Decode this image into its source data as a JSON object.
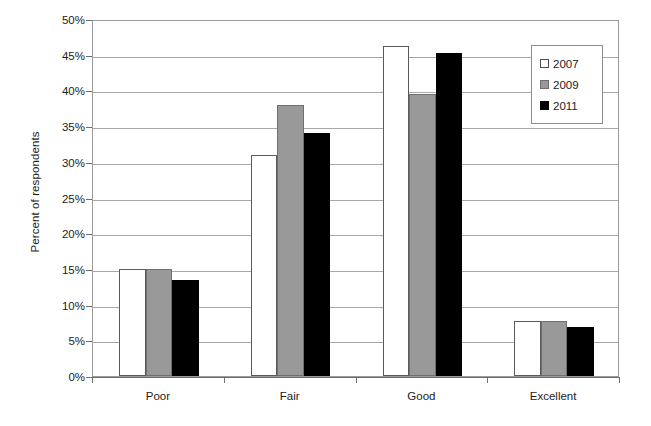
{
  "chart_data": {
    "type": "bar",
    "title": "",
    "subtitle": "",
    "xlabel": "",
    "ylabel": "Percent of respondents",
    "categories": [
      "Poor",
      "Fair",
      "Good",
      "Excellent"
    ],
    "series": [
      {
        "name": "2007",
        "color": "#ffffff",
        "values": [
          15.0,
          31.0,
          46.2,
          7.7
        ]
      },
      {
        "name": "2009",
        "color": "#999999",
        "values": [
          15.0,
          38.0,
          39.5,
          7.7
        ]
      },
      {
        "name": "2011",
        "color": "#000000",
        "values": [
          13.4,
          34.0,
          45.3,
          6.9
        ]
      }
    ],
    "ylim": [
      0,
      50
    ],
    "y_tick_step": 5,
    "y_tick_labels": [
      "0%",
      "5%",
      "10%",
      "15%",
      "20%",
      "25%",
      "30%",
      "35%",
      "40%",
      "45%",
      "50%"
    ],
    "grid": true,
    "grid_axis": "y",
    "legend_position": "top-right",
    "value_suffix": "%"
  },
  "legend": {
    "entries": [
      "2007",
      "2009",
      "2011"
    ]
  }
}
